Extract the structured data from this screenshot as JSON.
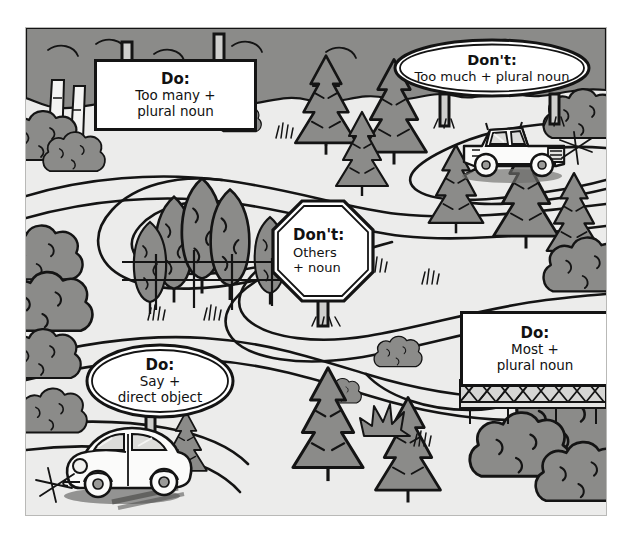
{
  "illustration": {
    "title": "Forest road with grammar instruction signs",
    "palette": {
      "paper": "#ffffff",
      "ground": "#ececeb",
      "foliage": "#8b8b89",
      "foliage_dark": "#74747 2",
      "ink": "#141414",
      "road": "#f2f2f1",
      "sign_face": "#ffffff"
    }
  },
  "signs": [
    {
      "id": "sign-do-too-many",
      "shape": "rectangle-billboard",
      "heading": "Do:",
      "lines": [
        "Too many +",
        "plural noun"
      ]
    },
    {
      "id": "sign-dont-too-much",
      "shape": "oval",
      "heading": "Don't:",
      "lines": [
        "Too much + plural noun"
      ]
    },
    {
      "id": "sign-dont-others",
      "shape": "octagon",
      "heading": "Don't:",
      "lines": [
        "Others",
        "+ noun"
      ]
    },
    {
      "id": "sign-do-most",
      "shape": "rectangle-billboard",
      "heading": "Do:",
      "lines": [
        "Most +",
        "plural noun"
      ]
    },
    {
      "id": "sign-do-say",
      "shape": "oval",
      "heading": "Do:",
      "lines": [
        "Say +",
        "direct object"
      ]
    }
  ],
  "vehicles": [
    {
      "id": "pickup-truck",
      "type": "pickup-truck",
      "facing": "right"
    },
    {
      "id": "beetle-car",
      "type": "beetle-car",
      "facing": "left"
    }
  ],
  "scenery": {
    "conifers": 14,
    "deciduous_clusters": 9,
    "fence": "horizontal rail fence near center",
    "trestle": "lattice trestle under right billboard",
    "road": "winding switchback road"
  }
}
